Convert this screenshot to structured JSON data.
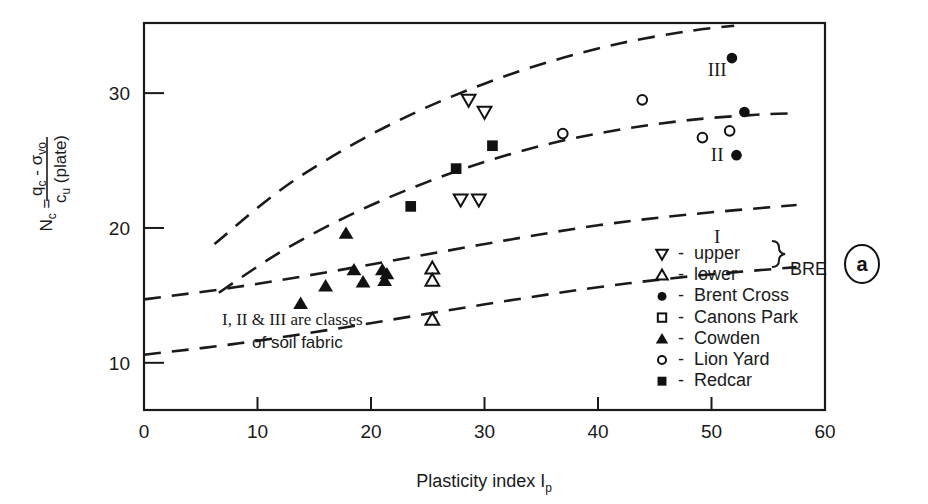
{
  "panel_label": "a",
  "annotation": {
    "line1": "I, II & III are classes",
    "line2": "of soil fabric"
  },
  "axes": {
    "x": {
      "title_main": "Plasticity index I",
      "title_sub": "p",
      "ticks": [
        0,
        10,
        20,
        30,
        40,
        50,
        60
      ],
      "min": 0,
      "max": 60
    },
    "y": {
      "label_lhs": "N",
      "label_lhs_sub": "c",
      "label_eq": " = ",
      "numerator_a": "q",
      "numerator_a_sub": "c",
      "numerator_minus": " - ",
      "numerator_b": "σ",
      "numerator_b_sub": "vo",
      "denominator_a": "c",
      "denominator_a_sub": "u",
      "denominator_b": " (plate)",
      "ticks": [
        10,
        20,
        30
      ],
      "min": 6.5,
      "max": 35.2
    }
  },
  "class_labels": [
    {
      "text": "III",
      "x": 50.5,
      "y": 31.8
    },
    {
      "text": "II",
      "x": 50.5,
      "y": 25.5
    },
    {
      "text": "I",
      "x": 50.5,
      "y": 19.4
    }
  ],
  "legend": {
    "brace_label": "BRE",
    "items": [
      {
        "symbol": "triangle-down-open",
        "dash": "-",
        "label": "upper"
      },
      {
        "symbol": "triangle-up-open",
        "dash": "-",
        "label": "lower"
      },
      {
        "symbol": "circle-filled",
        "dash": "-",
        "label": "Brent Cross"
      },
      {
        "symbol": "square-open",
        "dash": "-",
        "label": "Canons Park"
      },
      {
        "symbol": "triangle-up-filled",
        "dash": "-",
        "label": "Cowden"
      },
      {
        "symbol": "circle-open",
        "dash": "-",
        "label": "Lion Yard"
      },
      {
        "symbol": "square-filled",
        "dash": "-",
        "label": "Redcar"
      }
    ]
  },
  "chart_data": {
    "type": "scatter",
    "title": "",
    "xlabel": "Plasticity index Ip",
    "ylabel": "Nc = (qc - sigma_vo) / cu (plate)",
    "xlim": [
      0,
      60
    ],
    "ylim": [
      6.5,
      35.2
    ],
    "grid": false,
    "legend_position": "inside-bottom-right",
    "series": [
      {
        "name": "upper BRE",
        "symbol": "triangle-down-open",
        "points": [
          {
            "x": 28.6,
            "y": 29.5
          },
          {
            "x": 30.0,
            "y": 28.6
          },
          {
            "x": 27.9,
            "y": 22.1
          },
          {
            "x": 29.5,
            "y": 22.1
          }
        ]
      },
      {
        "name": "lower BRE",
        "symbol": "triangle-up-open",
        "points": [
          {
            "x": 25.4,
            "y": 17.0
          },
          {
            "x": 25.4,
            "y": 16.1
          },
          {
            "x": 25.4,
            "y": 13.2
          }
        ]
      },
      {
        "name": "Brent Cross",
        "symbol": "circle-filled",
        "points": [
          {
            "x": 51.8,
            "y": 32.6
          },
          {
            "x": 52.9,
            "y": 28.6
          },
          {
            "x": 52.2,
            "y": 25.4
          }
        ]
      },
      {
        "name": "Canons Park",
        "symbol": "square-open",
        "points": []
      },
      {
        "name": "Cowden",
        "symbol": "triangle-up-filled",
        "points": [
          {
            "x": 13.8,
            "y": 14.4
          },
          {
            "x": 16.0,
            "y": 15.7
          },
          {
            "x": 17.8,
            "y": 19.6
          },
          {
            "x": 18.5,
            "y": 16.9
          },
          {
            "x": 19.3,
            "y": 16.0
          },
          {
            "x": 21.0,
            "y": 16.9
          },
          {
            "x": 21.2,
            "y": 16.1
          },
          {
            "x": 21.4,
            "y": 16.6
          }
        ]
      },
      {
        "name": "Lion Yard",
        "symbol": "circle-open",
        "points": [
          {
            "x": 36.9,
            "y": 27.0
          },
          {
            "x": 43.9,
            "y": 29.5
          },
          {
            "x": 49.2,
            "y": 26.7
          },
          {
            "x": 51.6,
            "y": 27.2
          }
        ]
      },
      {
        "name": "Redcar",
        "symbol": "square-filled",
        "points": [
          {
            "x": 23.5,
            "y": 21.6
          },
          {
            "x": 27.5,
            "y": 24.4
          },
          {
            "x": 30.7,
            "y": 26.1
          }
        ]
      }
    ],
    "boundary_curves": [
      {
        "name": "class-III-upper-boundary",
        "style": "dashed",
        "points": [
          {
            "x": 6.2,
            "y": 18.8
          },
          {
            "x": 12,
            "y": 22.8
          },
          {
            "x": 18,
            "y": 26.0
          },
          {
            "x": 24,
            "y": 28.6
          },
          {
            "x": 30,
            "y": 30.7
          },
          {
            "x": 36,
            "y": 32.4
          },
          {
            "x": 42,
            "y": 33.7
          },
          {
            "x": 48,
            "y": 34.6
          },
          {
            "x": 52,
            "y": 35.0
          }
        ]
      },
      {
        "name": "class-II-III-boundary",
        "style": "dashed",
        "points": [
          {
            "x": 6.6,
            "y": 15.2
          },
          {
            "x": 12,
            "y": 18.2
          },
          {
            "x": 18,
            "y": 20.9
          },
          {
            "x": 24,
            "y": 23.1
          },
          {
            "x": 30,
            "y": 24.9
          },
          {
            "x": 36,
            "y": 26.3
          },
          {
            "x": 42,
            "y": 27.3
          },
          {
            "x": 48,
            "y": 28.0
          },
          {
            "x": 54,
            "y": 28.4
          },
          {
            "x": 57.5,
            "y": 28.5
          }
        ]
      },
      {
        "name": "class-I-II-boundary",
        "style": "dashed",
        "points": [
          {
            "x": 0,
            "y": 14.7
          },
          {
            "x": 8,
            "y": 15.6
          },
          {
            "x": 16,
            "y": 16.7
          },
          {
            "x": 24,
            "y": 17.9
          },
          {
            "x": 32,
            "y": 19.1
          },
          {
            "x": 40,
            "y": 20.2
          },
          {
            "x": 48,
            "y": 21.0
          },
          {
            "x": 57.5,
            "y": 21.7
          }
        ]
      },
      {
        "name": "class-I-lower-boundary",
        "style": "dashed",
        "points": [
          {
            "x": 0,
            "y": 10.6
          },
          {
            "x": 8,
            "y": 11.4
          },
          {
            "x": 16,
            "y": 12.4
          },
          {
            "x": 24,
            "y": 13.5
          },
          {
            "x": 32,
            "y": 14.6
          },
          {
            "x": 40,
            "y": 15.6
          },
          {
            "x": 48,
            "y": 16.4
          },
          {
            "x": 57.5,
            "y": 17.1
          }
        ]
      }
    ]
  }
}
